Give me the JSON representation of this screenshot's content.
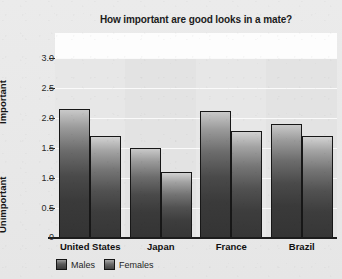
{
  "chart_data": {
    "type": "bar",
    "title": "How important are good looks in a mate?",
    "xlabel": "",
    "ylabel": "",
    "categories": [
      "United States",
      "Japan",
      "France",
      "Brazil"
    ],
    "series": [
      {
        "name": "Males",
        "values": [
          2.15,
          1.5,
          2.12,
          1.9
        ]
      },
      {
        "name": "Females",
        "values": [
          1.7,
          1.1,
          1.78,
          1.7
        ]
      }
    ],
    "ylim": [
      0,
      3.25
    ],
    "yticks": [
      "0",
      "0.5",
      "1.0",
      "1.5",
      "2.0",
      "2.5",
      "3.0"
    ],
    "ytick_values": [
      0,
      0.5,
      1.0,
      1.5,
      2.0,
      2.5,
      3.0
    ],
    "axis_high_label": "Important",
    "axis_low_label": "Unimportant",
    "grid": true,
    "legend_position": "bottom-left",
    "colors": {
      "males": "#3a3a3a",
      "females": "#434343",
      "plot_background": "#e3e3e3",
      "figure_background": "#e9e9e9",
      "gridline": "#fafafa",
      "axis": "#1c1c1c",
      "text": "#101010"
    }
  }
}
